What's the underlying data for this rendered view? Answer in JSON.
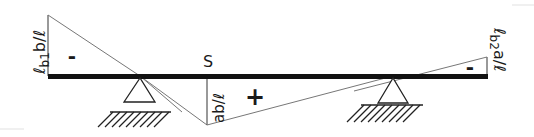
{
  "diagram": {
    "labels": {
      "left_ordinate": "ℓb1b/ℓ",
      "left_ordinate_parts": {
        "script_l": "ℓ",
        "sub": "b1",
        "rest": "b/ℓ"
      },
      "right_ordinate": "ℓb2a/ℓ",
      "right_ordinate_parts": {
        "script_l": "ℓ",
        "sub": "b2",
        "rest": "a/ℓ"
      },
      "section": "S",
      "mid_ordinate": "ab/ℓ",
      "left_sign": "-",
      "middle_sign": "+",
      "right_sign": "-"
    },
    "colors": {
      "beam": "#111111",
      "lines": "#555555",
      "text": "#1a1a1a",
      "background": "#ffffff"
    }
  }
}
